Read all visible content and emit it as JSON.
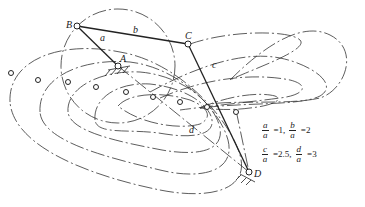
{
  "diagram": {
    "type": "four-bar linkage coupler curves",
    "joints": [
      {
        "id": "A",
        "label": "A",
        "x": 118,
        "y": 66,
        "fixed": true
      },
      {
        "id": "B",
        "label": "B",
        "x": 77,
        "y": 26
      },
      {
        "id": "C",
        "label": "C",
        "x": 188,
        "y": 44
      },
      {
        "id": "D",
        "label": "D",
        "x": 249,
        "y": 172,
        "fixed": true
      }
    ],
    "links": [
      {
        "id": "a",
        "label": "a",
        "from": "A",
        "to": "B"
      },
      {
        "id": "b",
        "label": "b",
        "from": "B",
        "to": "C"
      },
      {
        "id": "c",
        "label": "c",
        "from": "C",
        "to": "D"
      },
      {
        "id": "d",
        "label": "d",
        "from": "A",
        "to": "D"
      }
    ],
    "ratios": [
      {
        "num": "a",
        "den": "a",
        "value": "=1,"
      },
      {
        "num": "b",
        "den": "a",
        "value": "=2"
      },
      {
        "num": "c",
        "den": "a",
        "value": "=2.5,"
      },
      {
        "num": "d",
        "den": "a",
        "value": "=3"
      }
    ]
  }
}
